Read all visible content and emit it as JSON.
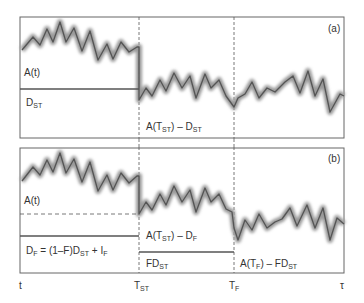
{
  "panels": {
    "a": {
      "tag": "(a)",
      "labels": {
        "signal": "A(t)",
        "threshold_main": "D",
        "threshold_sub": "ST",
        "region2_pre": "A(T",
        "region2_sub": "ST",
        "region2_post": ") – D",
        "region2_sub2": "ST"
      }
    },
    "b": {
      "tag": "(b)",
      "labels": {
        "signal": "A(t)",
        "df_eq_main": "D",
        "df_eq_sub": "F",
        "df_eq_mid": " = (1–F)D",
        "df_eq_sub2": "ST",
        "df_eq_end": " + I",
        "df_eq_sub3": "F",
        "region2_pre": "A(T",
        "region2_sub": "ST",
        "region2_post": ") – D",
        "region2_sub2": "F",
        "fd_main": "FD",
        "fd_sub": "ST",
        "region3_pre": "A(T",
        "region3_sub": "F",
        "region3_post": ") – FD",
        "region3_sub2": "ST"
      }
    }
  },
  "axis": {
    "t": "t",
    "tst_main": "T",
    "tst_sub": "ST",
    "tf_main": "T",
    "tf_sub": "F",
    "tau": "τ"
  },
  "colors": {
    "line": "#555555",
    "glow": "#9a9a9a",
    "frame": "#666666"
  }
}
